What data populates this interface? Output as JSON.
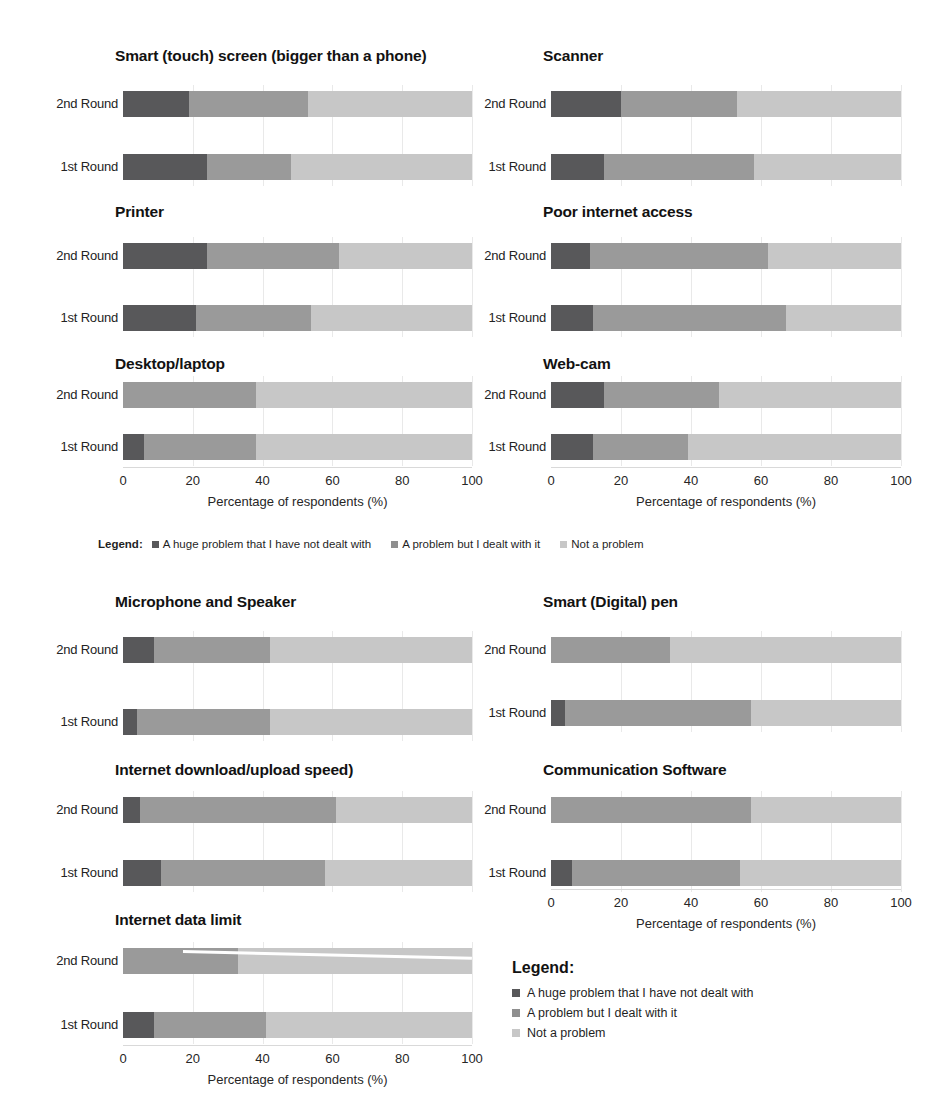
{
  "top_cut_text": "",
  "axis": {
    "title": "Percentage of respondents (%)",
    "ticks": [
      "0",
      "20",
      "40",
      "60",
      "80",
      "100"
    ],
    "tick_values": [
      0,
      20,
      40,
      60,
      80,
      100
    ],
    "min": 0,
    "max": 100
  },
  "row_labels": [
    "2nd Round",
    "1st Round"
  ],
  "legend_inline": {
    "title": "Legend:",
    "items": [
      "A huge problem that I have not dealt with",
      "A problem but I dealt with it",
      "Not a problem"
    ]
  },
  "legend_block": {
    "title": "Legend:",
    "items": [
      "A huge problem that I have not dealt with",
      "A problem but I dealt with it",
      "Not a problem"
    ]
  },
  "colors": {
    "huge_problem": "#58585a",
    "dealt_with": "#9a9a9a",
    "not_a_problem": "#c7c7c7",
    "gridline": "#e9e9e9",
    "text": "#1a1a1a"
  },
  "chart_data": {
    "type": "bar",
    "orientation": "horizontal",
    "stacked": true,
    "normalized_percent": true,
    "xlabel": "Percentage of respondents (%)",
    "ylabel": "",
    "xlim": [
      0,
      100
    ],
    "xticks": [
      0,
      20,
      40,
      60,
      80,
      100
    ],
    "grid": true,
    "legend_position": "center-between-sections",
    "series": [
      {
        "name": "A huge problem that I have not dealt with",
        "color": "#58585a"
      },
      {
        "name": "A problem but I dealt with it",
        "color": "#9a9a9a"
      },
      {
        "name": "Not a problem",
        "color": "#c7c7c7"
      }
    ],
    "categories": [
      "2nd Round",
      "1st Round"
    ],
    "panels": [
      {
        "title": "Smart (touch) screen (bigger than a phone)",
        "section": "top",
        "column": "left",
        "rows": [
          {
            "label": "2nd Round",
            "values": [
              19,
              34,
              47
            ]
          },
          {
            "label": "1st Round",
            "values": [
              24,
              24,
              52
            ]
          }
        ]
      },
      {
        "title": "Scanner",
        "section": "top",
        "column": "right",
        "rows": [
          {
            "label": "2nd Round",
            "values": [
              20,
              33,
              47
            ]
          },
          {
            "label": "1st Round",
            "values": [
              15,
              43,
              42
            ]
          }
        ]
      },
      {
        "title": "Printer",
        "section": "top",
        "column": "left",
        "rows": [
          {
            "label": "2nd Round",
            "values": [
              24,
              38,
              38
            ]
          },
          {
            "label": "1st Round",
            "values": [
              21,
              33,
              46
            ]
          }
        ]
      },
      {
        "title": "Poor internet access",
        "section": "top",
        "column": "right",
        "rows": [
          {
            "label": "2nd Round",
            "values": [
              11,
              51,
              38
            ]
          },
          {
            "label": "1st Round",
            "values": [
              12,
              55,
              33
            ]
          }
        ]
      },
      {
        "title": "Desktop/laptop",
        "section": "top",
        "column": "left",
        "rows": [
          {
            "label": "2nd Round",
            "values": [
              0,
              38,
              62
            ]
          },
          {
            "label": "1st Round",
            "values": [
              6,
              32,
              62
            ]
          }
        ]
      },
      {
        "title": "Web-cam",
        "section": "top",
        "column": "right",
        "rows": [
          {
            "label": "2nd Round",
            "values": [
              15,
              33,
              52
            ]
          },
          {
            "label": "1st Round",
            "values": [
              12,
              27,
              61
            ]
          }
        ]
      },
      {
        "title": "Microphone and Speaker",
        "section": "bottom",
        "column": "left",
        "rows": [
          {
            "label": "2nd Round",
            "values": [
              9,
              33,
              58
            ]
          },
          {
            "label": "1st Round",
            "values": [
              4,
              38,
              58
            ]
          }
        ]
      },
      {
        "title": "Smart (Digital) pen",
        "section": "bottom",
        "column": "right",
        "rows": [
          {
            "label": "2nd Round",
            "values": [
              0,
              34,
              66
            ]
          },
          {
            "label": "1st Round",
            "values": [
              4,
              53,
              43
            ]
          }
        ]
      },
      {
        "title": "Internet download/upload speed)",
        "section": "bottom",
        "column": "left",
        "rows": [
          {
            "label": "2nd Round",
            "values": [
              5,
              56,
              39
            ]
          },
          {
            "label": "1st Round",
            "values": [
              11,
              47,
              42
            ]
          }
        ]
      },
      {
        "title": "Communication Software",
        "section": "bottom",
        "column": "right",
        "rows": [
          {
            "label": "2nd Round",
            "values": [
              0,
              57,
              43
            ]
          },
          {
            "label": "1st Round",
            "values": [
              6,
              48,
              46
            ]
          }
        ]
      },
      {
        "title": "Internet data limit",
        "section": "bottom",
        "column": "left",
        "rows": [
          {
            "label": "2nd Round",
            "values": [
              0,
              33,
              67
            ]
          },
          {
            "label": "1st Round",
            "values": [
              9,
              32,
              59
            ]
          }
        ]
      }
    ]
  }
}
